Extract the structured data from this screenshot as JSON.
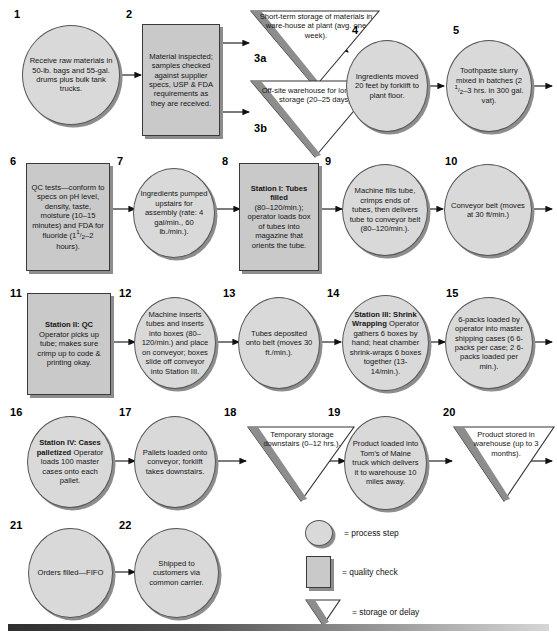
{
  "diagram": {
    "colors": {
      "circle_fill": "#d9d9d9",
      "box_fill": "#c9c9c9",
      "triangle_fill": "#ffffff",
      "triangle_limb": "#8d8d8d",
      "shadow": "#8d8d8d",
      "stroke": "#3a3a3a"
    }
  },
  "steps": [
    {
      "num": "1",
      "shape": "circle",
      "text": "Receive raw materials in 50-lb. bags and 55-gal. drums plus bulk tank trucks."
    },
    {
      "num": "2",
      "shape": "box",
      "text": "Material inspected; samples checked against supplier specs, USP & FDA requirements as they are received."
    },
    {
      "num": "3a",
      "shape": "triangle",
      "text": "Short-term storage of materials in ware-house at plant (avg. one week)."
    },
    {
      "num": "3b",
      "shape": "triangle",
      "text": "Off-site warehouse for long-term storage (20–25 days)."
    },
    {
      "num": "4",
      "shape": "circle",
      "text": "Ingredients moved 20 feet by forklift to plant floor."
    },
    {
      "num": "5",
      "shape": "circle",
      "text": "Toothpaste slurry mixed in batches (2½–3 hrs. in 300 gal. vat)."
    },
    {
      "num": "6",
      "shape": "box",
      "text": "QC tests—conform to specs on pH level, density, taste, moisture (10–15 minutes) and FDA for fluoride (1½–2 hours)."
    },
    {
      "num": "7",
      "shape": "circle",
      "text": "Ingredients pumped upstairs for assembly (rate: 4 gal/min., 60 lb./min.)."
    },
    {
      "num": "8",
      "shape": "box",
      "heading": "Station I: Tubes filled",
      "text": "(80–120/min.); operator loads box of tubes into magazine that orients the tube."
    },
    {
      "num": "9",
      "shape": "circle",
      "text": "Machine fills tube, crimps ends of tubes, then delivers tube to conveyor belt (80–120/min.)."
    },
    {
      "num": "10",
      "shape": "circle",
      "text": "Conveyor belt (moves at 30 ft/min.)"
    },
    {
      "num": "11",
      "shape": "box",
      "heading": "Station II: QC",
      "text": "Operator picks up tube; makes sure crimp up to code & printing okay."
    },
    {
      "num": "12",
      "shape": "circle",
      "text": "Machine inserts tubes and inserts into boxes (80–120/min.) and place on conveyor; boxes slide off conveyor into Station III."
    },
    {
      "num": "13",
      "shape": "circle",
      "text": "Tubes deposited onto belt (moves 30 ft./min.)."
    },
    {
      "num": "14",
      "shape": "circle",
      "heading": "Station III: Shrink Wrapping",
      "text": "Operator gathers 6 boxes by hand; heat chamber shrink-wraps 6 boxes together (13-14/min.)."
    },
    {
      "num": "15",
      "shape": "circle",
      "text": "6-packs loaded by operator into master shipping cases (6 6-packs per case; 2 6-packs loaded per min.)."
    },
    {
      "num": "16",
      "shape": "circle",
      "heading": "Station IV: Cases palletized",
      "text": "Operator loads 100 master cases onto each pallet."
    },
    {
      "num": "17",
      "shape": "circle",
      "text": "Pallets loaded onto conveyor; forklift takes downstairs."
    },
    {
      "num": "18",
      "shape": "triangle",
      "text": "Temporary storage downstairs (0–12 hrs.)."
    },
    {
      "num": "19",
      "shape": "circle",
      "text": "Product loaded into Tom's of Maine truck which delivers it to warehouse 10 miles away."
    },
    {
      "num": "20",
      "shape": "triangle",
      "text": "Product stored in warehouse (up to 3 months)."
    },
    {
      "num": "21",
      "shape": "circle",
      "text": "Orders filled—FIFO"
    },
    {
      "num": "22",
      "shape": "circle",
      "text": "Shipped to customers via common carrier."
    }
  ],
  "legend": [
    {
      "symbol": "circle",
      "label": "= process step"
    },
    {
      "symbol": "box",
      "label": "= quality check"
    },
    {
      "symbol": "triangle",
      "label": "= storage or delay"
    }
  ]
}
